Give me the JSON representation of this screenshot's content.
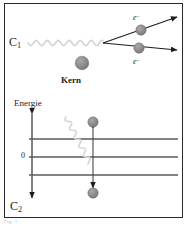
{
  "figure": {
    "width": 190,
    "height": 227,
    "background": "#ffffff",
    "border_color": "#2a2a2a",
    "caption": "Fig. 1"
  },
  "colors": {
    "sphere_fill": "#8a8a8a",
    "sphere_stroke": "#6e6e6e",
    "line_dark": "#1c1c1c",
    "photon_wave": "#d5d5d5",
    "energy_line": "#5a5a5a",
    "text": "#1c1c1c"
  },
  "upper_panel": {
    "name": "compton-scattering-diagram",
    "label_left": "C",
    "label_left_sub": "1",
    "nucleus_label": "Kern",
    "electron_upper_label": "e",
    "electron_upper_sup": "−",
    "electron_lower_label": "e",
    "electron_lower_sup": "−",
    "photon": {
      "name": "incoming-photon-wave",
      "start_x": 28,
      "end_x": 103,
      "y": 43,
      "amplitude": 2.6,
      "wavelength": 11
    },
    "vertex": {
      "x": 103,
      "y": 43
    },
    "rays": [
      {
        "name": "scattered-ray-upper",
        "x1": 103,
        "y1": 43,
        "x2": 180,
        "y2": 16
      },
      {
        "name": "scattered-ray-lower",
        "x1": 103,
        "y1": 43,
        "x2": 180,
        "y2": 51
      }
    ],
    "particles": [
      {
        "name": "electron-upper",
        "cx": 141,
        "cy": 30,
        "r": 5.2
      },
      {
        "name": "electron-lower",
        "cx": 139,
        "cy": 48,
        "r": 5.2
      },
      {
        "name": "nucleus",
        "cx": 82,
        "cy": 63,
        "r": 6.8
      }
    ]
  },
  "lower_panel": {
    "name": "energy-level-diagram",
    "axis_label": "Energie",
    "zero_label": "0",
    "label_bottom": "C",
    "label_bottom_sub": "2",
    "energy_axis": {
      "name": "energy-axis-arrow",
      "x": 32,
      "y_top": 112,
      "y_bottom": 200
    },
    "levels": [
      {
        "name": "energy-level-upper",
        "y": 139,
        "x1": 29,
        "x2": 178
      },
      {
        "name": "energy-level-zero",
        "y": 157,
        "x1": 29,
        "x2": 178
      },
      {
        "name": "energy-level-lower",
        "y": 175,
        "x1": 29,
        "x2": 178
      }
    ],
    "transition_arrow": {
      "name": "transition-double-arrow",
      "x": 93,
      "y_top": 127,
      "y_bottom": 190
    },
    "particles": [
      {
        "name": "particle-upper-state",
        "cx": 93,
        "cy": 122,
        "r": 5.2
      },
      {
        "name": "particle-lower-state",
        "cx": 93,
        "cy": 193,
        "r": 5.2
      }
    ],
    "photon": {
      "name": "emitted-photon-wave",
      "start_x": 66,
      "start_y": 117,
      "end_x": 90,
      "end_y": 163,
      "amplitude": 2.4,
      "wavelength": 10
    }
  }
}
